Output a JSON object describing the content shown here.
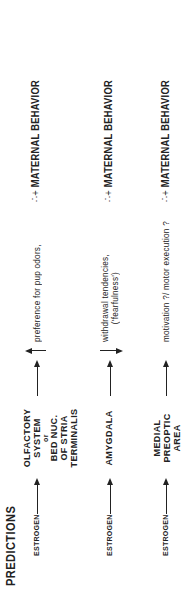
{
  "title": "PREDICTIONS",
  "rows": [
    {
      "input": "ESTROGEN",
      "region_lines": [
        "OLFACTORY",
        "SYSTEM",
        "or",
        "BED NUC.",
        "OF STRIA",
        "TERMINALIS"
      ],
      "direction": "up",
      "effect_lines": [
        "preference for pup odors,"
      ],
      "outcome_symbol": "∴+",
      "outcome": "MATERNAL BEHAVIOR"
    },
    {
      "input": "ESTROGEN",
      "region_lines": [
        "AMYGDALA"
      ],
      "direction": "down",
      "effect_lines": [
        "withdrawal tendencies,",
        "('fearfulness')"
      ],
      "outcome_symbol": "∴+",
      "outcome": "MATERNAL BEHAVIOR"
    },
    {
      "input": "ESTROGEN",
      "region_lines": [
        "MEDIAL",
        "PREOPTIC",
        "AREA"
      ],
      "direction": "none",
      "effect_lines": [
        "motivation ?/ motor execution ?"
      ],
      "outcome_symbol": "∴+",
      "outcome": "MATERNAL BEHAVIOR"
    }
  ]
}
